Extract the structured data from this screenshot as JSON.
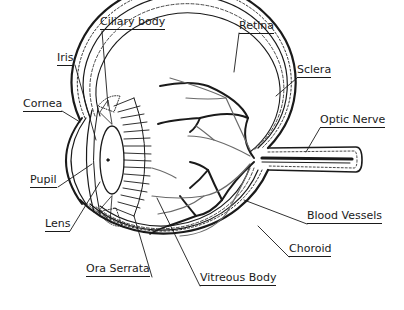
{
  "colors": {
    "ink": "#1a1a1a",
    "vessel_light": "#6a6a6a",
    "background": "#ffffff"
  },
  "labels": {
    "ciliary_body": "Ciliary body",
    "iris": "Iris",
    "cornea": "Cornea",
    "pupil": "Pupil",
    "lens": "Lens",
    "ora_serrata": "Ora Serrata",
    "vitreous_body": "Vitreous Body",
    "choroid": "Choroid",
    "blood_vessels": "Blood Vessels",
    "optic_nerve": "Optic Nerve",
    "sclera": "Sclera",
    "retina": "Retina"
  }
}
